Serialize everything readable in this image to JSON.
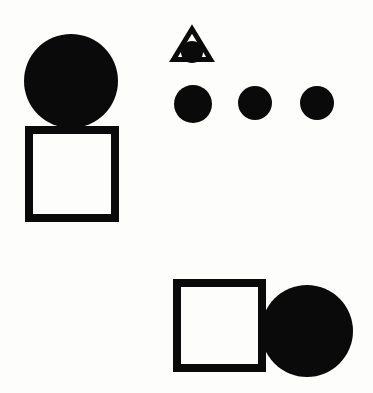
{
  "figure": {
    "canvas": {
      "width": 373,
      "height": 393
    },
    "background_color": "#fdfdfc",
    "shape_color": "#0a0a0a",
    "stroke_width": 8,
    "groups": [
      {
        "name": "circle-over-square-group",
        "description": "Filled circle resting on top of an unfilled square outline, upper-left",
        "shapes": [
          {
            "id": "circle-top-left",
            "type": "circle",
            "fill": "solid",
            "cx": 71,
            "cy": 81,
            "r": 47,
            "color": "#0a0a0a"
          },
          {
            "id": "square-upper-left",
            "type": "square",
            "fill": "outline",
            "x": 25,
            "y": 126,
            "width": 94,
            "height": 96,
            "stroke": 8,
            "color": "#0a0a0a"
          }
        ]
      },
      {
        "name": "triangle-with-circle-group",
        "description": "Unfilled triangle outline with a small filled circle inside near its base",
        "shapes": [
          {
            "id": "triangle-outline",
            "type": "triangle",
            "fill": "outline",
            "apex_x": 192,
            "apex_y": 25,
            "left_x": 171,
            "right_x": 213,
            "base_y": 62,
            "stroke": 5,
            "color": "#0a0a0a"
          },
          {
            "id": "circle-inside-triangle",
            "type": "circle",
            "fill": "solid",
            "cx": 192,
            "cy": 52,
            "r": 11,
            "color": "#0a0a0a"
          }
        ]
      },
      {
        "name": "three-circles-row",
        "description": "Row of three solid circles of similar size",
        "shapes": [
          {
            "id": "circle-row-1",
            "type": "circle",
            "fill": "solid",
            "cx": 193,
            "cy": 104,
            "r": 19,
            "color": "#0a0a0a"
          },
          {
            "id": "circle-row-2",
            "type": "circle",
            "fill": "solid",
            "cx": 255,
            "cy": 103,
            "r": 17,
            "color": "#0a0a0a"
          },
          {
            "id": "circle-row-3",
            "type": "circle",
            "fill": "solid",
            "cx": 317,
            "cy": 103,
            "r": 17,
            "color": "#0a0a0a"
          }
        ]
      },
      {
        "name": "square-beside-circle-group",
        "description": "Unfilled square outline overlapping a large filled circle to its right, lower-right",
        "shapes": [
          {
            "id": "circle-bottom-right",
            "type": "circle",
            "fill": "solid",
            "cx": 307,
            "cy": 331,
            "r": 46,
            "color": "#0a0a0a"
          },
          {
            "id": "square-lower-right",
            "type": "square",
            "fill": "outline",
            "x": 173,
            "y": 279,
            "width": 93,
            "height": 93,
            "stroke": 8,
            "color": "#0a0a0a"
          }
        ]
      }
    ]
  }
}
